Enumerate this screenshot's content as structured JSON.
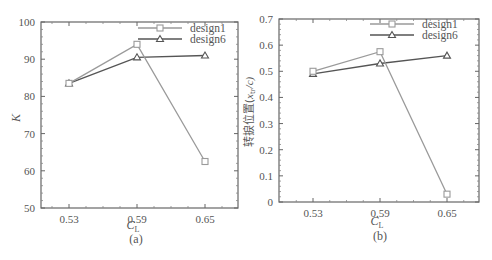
{
  "chart_data": [
    {
      "type": "line",
      "panel": "(a)",
      "title": "",
      "xlabel": "C_L",
      "ylabel": "K",
      "categories": [
        "0.53",
        "0.59",
        "0.65"
      ],
      "x": [
        0.53,
        0.59,
        0.65
      ],
      "ylim": [
        50,
        100
      ],
      "yticks": [
        "50",
        "60",
        "70",
        "80",
        "90",
        "100"
      ],
      "grid": false,
      "legend_position": "upper right",
      "series": [
        {
          "name": "design1",
          "marker": "square",
          "color": "#9a9a9a",
          "values": [
            83.5,
            94.0,
            62.5
          ]
        },
        {
          "name": "design6",
          "marker": "triangle",
          "color": "#555555",
          "values": [
            83.5,
            90.5,
            91.0
          ]
        }
      ]
    },
    {
      "type": "line",
      "panel": "(b)",
      "title": "",
      "xlabel": "C_L",
      "ylabel": "转捩位置(x_tr/c)",
      "categories": [
        "0.53",
        "0.59",
        "0.65"
      ],
      "x": [
        0.53,
        0.59,
        0.65
      ],
      "ylim": [
        0,
        0.7
      ],
      "yticks": [
        "0",
        "0.1",
        "0.2",
        "0.3",
        "0.4",
        "0.5",
        "0.6",
        "0.7"
      ],
      "grid": false,
      "legend_position": "upper right",
      "series": [
        {
          "name": "design1",
          "marker": "square",
          "color": "#9a9a9a",
          "values": [
            0.5,
            0.575,
            0.03
          ]
        },
        {
          "name": "design6",
          "marker": "triangle",
          "color": "#555555",
          "values": [
            0.49,
            0.53,
            0.56
          ]
        }
      ]
    }
  ],
  "labels": {
    "a": {
      "ylabel": "K",
      "xlabel_main": "C",
      "xlabel_sub": "L",
      "caption": "(a)"
    },
    "b": {
      "ylabel_cn": "转捩位置(",
      "ylabel_var": "x",
      "ylabel_sub": "tr",
      "ylabel_tail": "/c)",
      "xlabel_main": "C",
      "xlabel_sub": "L",
      "caption": "(b)"
    },
    "legend": [
      "design1",
      "design6"
    ]
  }
}
